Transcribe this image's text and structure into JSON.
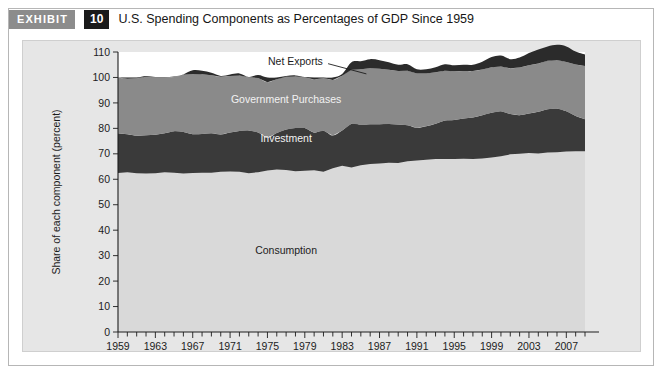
{
  "exhibit": {
    "tag_label": "EXHIBIT",
    "number": "10",
    "title": "U.S. Spending Components as Percentages of GDP Since 1959"
  },
  "chart_data": {
    "type": "area",
    "title": "U.S. Spending Components as Percentages of GDP Since 1959",
    "xlabel": "",
    "ylabel": "Share of each component (percent)",
    "ylim": [
      0,
      110
    ],
    "xlim": [
      1959,
      2009
    ],
    "ytick_step": 10,
    "yticks": [
      0,
      10,
      20,
      30,
      40,
      50,
      60,
      70,
      80,
      90,
      100,
      110
    ],
    "xticks": [
      1959,
      1963,
      1967,
      1971,
      1975,
      1979,
      1983,
      1987,
      1991,
      1995,
      1999,
      2003,
      2007
    ],
    "xtick_labels": [
      "1959",
      "1963",
      "1967",
      "1971",
      "1975",
      "1979",
      "1983",
      "1987",
      "1991",
      "1995",
      "1999",
      "2003",
      "2007"
    ],
    "xtick_minor_step": 1,
    "grid": false,
    "legend": "inline-annotations",
    "stacked": true,
    "colors": {
      "consumption": "#d9d9d9",
      "investment": "#3a3a3a",
      "government_purchases": "#8a8a8a",
      "net_exports": "#2b2b2b",
      "plot_background": "#e6e6e6",
      "above_hundred_background": "#ffffff"
    },
    "annotations": [
      {
        "text": "Net Exports",
        "x": 1978,
        "y": 106.5,
        "color": "#1c1c1c"
      },
      {
        "text": "Government Purchases",
        "x": 1977,
        "y": 91.5,
        "color": "#f2f2f2"
      },
      {
        "text": "Investment",
        "x": 1977,
        "y": 76.0,
        "color": "#f2f2f2"
      },
      {
        "text": "Consumption",
        "x": 1977,
        "y": 32.0,
        "color": "#1c1c1c"
      }
    ],
    "x": [
      1959,
      1960,
      1961,
      1962,
      1963,
      1964,
      1965,
      1966,
      1967,
      1968,
      1969,
      1970,
      1971,
      1972,
      1973,
      1974,
      1975,
      1976,
      1977,
      1978,
      1979,
      1980,
      1981,
      1982,
      1983,
      1984,
      1985,
      1986,
      1987,
      1988,
      1989,
      1990,
      1991,
      1992,
      1993,
      1994,
      1995,
      1996,
      1997,
      1998,
      1999,
      2000,
      2001,
      2002,
      2003,
      2004,
      2005,
      2006,
      2007,
      2008,
      2009
    ],
    "series": [
      {
        "name": "Consumption",
        "color": "#d9d9d9",
        "values": [
          62.5,
          62.8,
          62.4,
          62.3,
          62.4,
          62.8,
          62.6,
          62.3,
          62.5,
          62.6,
          62.6,
          63.0,
          63.1,
          63.0,
          62.4,
          62.8,
          63.4,
          63.8,
          63.6,
          63.2,
          63.3,
          63.5,
          63.0,
          64.3,
          65.3,
          64.6,
          65.5,
          66.0,
          66.2,
          66.5,
          66.4,
          67.1,
          67.4,
          67.7,
          68.0,
          68.0,
          68.0,
          68.1,
          68.0,
          68.2,
          68.6,
          69.0,
          69.8,
          70.0,
          70.3,
          70.1,
          70.5,
          70.6,
          70.9,
          71.0,
          71.0
        ]
      },
      {
        "name": "Investment",
        "color": "#3a3a3a",
        "values": [
          15.6,
          14.9,
          14.7,
          15.0,
          15.1,
          15.3,
          16.3,
          16.3,
          15.2,
          15.2,
          15.5,
          14.6,
          15.3,
          16.0,
          16.8,
          15.6,
          12.9,
          14.4,
          16.0,
          16.9,
          16.8,
          14.8,
          16.1,
          12.9,
          13.9,
          17.2,
          16.0,
          15.6,
          15.4,
          15.2,
          15.1,
          14.1,
          12.8,
          13.1,
          13.8,
          15.1,
          15.3,
          15.8,
          16.3,
          17.0,
          17.5,
          17.7,
          15.8,
          15.2,
          15.5,
          16.4,
          17.0,
          17.2,
          15.8,
          13.9,
          12.6
        ]
      },
      {
        "name": "Government Purchases",
        "color": "#8a8a8a",
        "values": [
          21.9,
          21.8,
          22.6,
          23.0,
          22.6,
          22.0,
          21.3,
          22.5,
          23.7,
          23.5,
          22.8,
          22.7,
          22.2,
          21.8,
          20.9,
          21.4,
          21.8,
          21.1,
          20.7,
          20.3,
          20.0,
          20.9,
          20.7,
          21.8,
          21.5,
          21.2,
          21.7,
          22.0,
          21.8,
          21.3,
          21.0,
          21.4,
          21.4,
          20.8,
          20.2,
          19.5,
          19.1,
          18.6,
          18.2,
          17.9,
          17.9,
          17.6,
          18.0,
          18.7,
          19.0,
          19.0,
          19.1,
          19.1,
          19.4,
          20.2,
          20.9
        ]
      },
      {
        "name": "Net Exports",
        "color": "#2b2b2b",
        "note": "plotted above the 100 line as the absolute value of the (mostly negative) trade balance",
        "values": [
          0.0,
          0.5,
          0.3,
          0.3,
          0.1,
          0.1,
          0.2,
          0.1,
          1.4,
          1.3,
          0.9,
          0.3,
          0.6,
          0.8,
          0.1,
          1.2,
          1.9,
          0.7,
          0.3,
          0.4,
          0.1,
          0.8,
          0.2,
          1.0,
          0.7,
          3.0,
          3.2,
          3.6,
          3.4,
          3.0,
          2.5,
          2.6,
          1.6,
          1.6,
          2.0,
          2.6,
          2.4,
          2.5,
          2.5,
          3.1,
          4.0,
          4.3,
          3.6,
          3.9,
          4.8,
          5.5,
          5.6,
          5.9,
          6.1,
          5.1,
          4.5
        ]
      }
    ]
  },
  "axes": {
    "y_axis_title": "Share of each component (percent)"
  }
}
